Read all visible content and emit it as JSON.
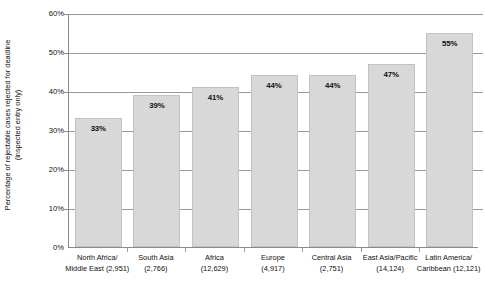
{
  "chart_data": {
    "type": "bar",
    "title": "",
    "xlabel": "",
    "ylabel": "Percentage of rejectable cases rejected for deadline (inspected entry only)",
    "ylabel_line1": "Percentage of rejectable cases rejected for deadline",
    "ylabel_line2": "(inspected entry only)",
    "ylim": [
      0,
      60
    ],
    "grid": true,
    "legend": "none",
    "yticks": [
      "0%",
      "10%",
      "20%",
      "30%",
      "40%",
      "50%",
      "60%"
    ],
    "ytick_values": [
      0,
      10,
      20,
      30,
      40,
      50,
      60
    ],
    "categories": [
      "North Africa/ Middle East (2,951)",
      "South Asia (2,766)",
      "Africa (12,629)",
      "Europe (4,917)",
      "Central Asia (2,751)",
      "East Asia/Pacific (14,124)",
      "Latin America/ Caribbean (12,121)"
    ],
    "category_lines": [
      [
        "North Africa/",
        "Middle East (2,951)"
      ],
      [
        "South Asia",
        "(2,766)"
      ],
      [
        "Africa",
        "(12,629)"
      ],
      [
        "Europe",
        "(4,917)"
      ],
      [
        "Central Asia",
        "(2,751)"
      ],
      [
        "East Asia/Pacific",
        "(14,124)"
      ],
      [
        "Latin America/",
        "Caribbean (12,121)"
      ]
    ],
    "values": [
      33,
      39,
      41,
      44,
      44,
      47,
      55
    ],
    "value_labels": [
      "33%",
      "39%",
      "41%",
      "44%",
      "44%",
      "47%",
      "55%"
    ],
    "counts": [
      2951,
      2766,
      12629,
      4917,
      2751,
      14124,
      12121
    ],
    "bar_color": "#d8d8d8",
    "bar_border_color": "#c2c2c2",
    "gridline_color": "#9a9a9a",
    "axis_color": "#8a8a8a",
    "text_color": "#111111",
    "background_color": "#ffffff"
  }
}
